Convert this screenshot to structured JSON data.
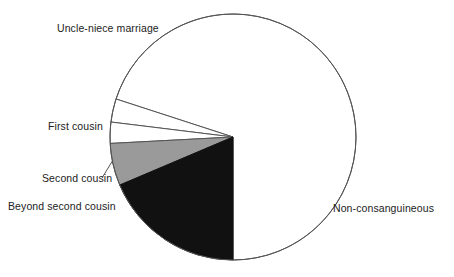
{
  "figure": {
    "background_color": "#ffffff",
    "outline_color": "#555555",
    "width": 454,
    "height": 277
  },
  "chart_data": {
    "type": "pie",
    "title": "",
    "subtitle": "",
    "xlabel": "",
    "ylabel": "",
    "grid": false,
    "legend_position": "none",
    "label_placement": "outside-left-and-right",
    "start_angle_deg": 270,
    "direction": "counterclockwise",
    "center": {
      "x": 233,
      "y": 137
    },
    "radius": 123,
    "categories": [
      "Non-consanguineous",
      "Uncle-niece marriage",
      "First cousin",
      "Second cousin",
      "Beyond second cousin"
    ],
    "values": [
      70.0,
      18.6,
      5.6,
      2.8,
      3.0
    ],
    "units": "percent",
    "slices": [
      {
        "label": "Uncle-niece marriage",
        "value": 18.6,
        "color": "#111111",
        "color_name": "black",
        "start_angle_deg": 270,
        "end_angle_deg": 203
      },
      {
        "label": "First cousin",
        "value": 5.6,
        "color": "#9a9a9a",
        "color_name": "gray",
        "start_angle_deg": 203,
        "end_angle_deg": 183
      },
      {
        "label": "Second cousin",
        "value": 2.8,
        "color": "#ffffff",
        "color_name": "white",
        "start_angle_deg": 183,
        "end_angle_deg": 173
      },
      {
        "label": "Beyond second cousin",
        "value": 3.0,
        "color": "#ffffff",
        "color_name": "white",
        "start_angle_deg": 173,
        "end_angle_deg": 162
      },
      {
        "label": "Non-consanguineous",
        "value": 70.0,
        "color": "#ffffff",
        "color_name": "white",
        "start_angle_deg": 162,
        "end_angle_deg": -90
      }
    ]
  },
  "labels": {
    "uncle_niece": "Uncle-niece marriage",
    "first_cousin": "First cousin",
    "second_cousin": "Second cousin",
    "beyond_second_cousin": "Beyond second cousin",
    "non_consanguineous": "Non-consanguineous"
  }
}
